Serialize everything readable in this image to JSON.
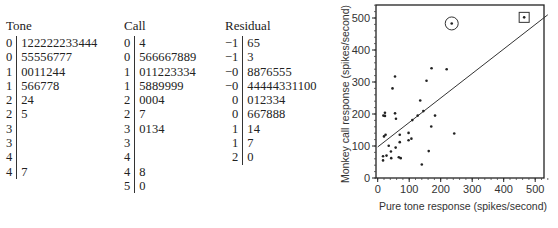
{
  "stem_plots": {
    "tone": {
      "title": "Tone",
      "rows": [
        {
          "stem": "0",
          "leaves": "122222233444"
        },
        {
          "stem": "0",
          "leaves": "55556777"
        },
        {
          "stem": "1",
          "leaves": "0011244"
        },
        {
          "stem": "1",
          "leaves": "566778"
        },
        {
          "stem": "2",
          "leaves": "24"
        },
        {
          "stem": "2",
          "leaves": "5"
        },
        {
          "stem": "3",
          "leaves": ""
        },
        {
          "stem": "3",
          "leaves": ""
        },
        {
          "stem": "4",
          "leaves": ""
        },
        {
          "stem": "4",
          "leaves": "7"
        }
      ]
    },
    "call": {
      "title": "Call",
      "rows": [
        {
          "stem": "0",
          "leaves": "4"
        },
        {
          "stem": "0",
          "leaves": "566667889"
        },
        {
          "stem": "1",
          "leaves": "011223334"
        },
        {
          "stem": "1",
          "leaves": "5889999"
        },
        {
          "stem": "2",
          "leaves": "0004"
        },
        {
          "stem": "2",
          "leaves": "7"
        },
        {
          "stem": "3",
          "leaves": "0134"
        },
        {
          "stem": "3",
          "leaves": ""
        },
        {
          "stem": "4",
          "leaves": ""
        },
        {
          "stem": "4",
          "leaves": "8"
        },
        {
          "stem": "5",
          "leaves": "0"
        }
      ]
    },
    "residual": {
      "title": "Residual",
      "rows": [
        {
          "stem": "−1",
          "leaves": "65"
        },
        {
          "stem": "−1",
          "leaves": "3"
        },
        {
          "stem": "−0",
          "leaves": "8876555"
        },
        {
          "stem": "−0",
          "leaves": "44444331100"
        },
        {
          "stem": "0",
          "leaves": "012334"
        },
        {
          "stem": "0",
          "leaves": "667888"
        },
        {
          "stem": "1",
          "leaves": "14"
        },
        {
          "stem": "1",
          "leaves": "7"
        },
        {
          "stem": "2",
          "leaves": "0"
        }
      ]
    }
  },
  "chart_data": {
    "type": "scatter",
    "title": "",
    "xlabel": "Pure tone response (spikes/second)",
    "ylabel": "Monkey call response (spikes/second)",
    "xlim": [
      0,
      540
    ],
    "ylim": [
      0,
      540
    ],
    "xticks": [
      0,
      100,
      200,
      300,
      400,
      500
    ],
    "yticks": [
      0,
      100,
      200,
      300,
      400,
      500
    ],
    "grid": false,
    "legend": null,
    "points": [
      {
        "x": 55,
        "y": 317
      },
      {
        "x": 47,
        "y": 280
      },
      {
        "x": 171,
        "y": 343
      },
      {
        "x": 219,
        "y": 340
      },
      {
        "x": 155,
        "y": 304
      },
      {
        "x": 18,
        "y": 195
      },
      {
        "x": 23,
        "y": 194
      },
      {
        "x": 23,
        "y": 204
      },
      {
        "x": 55,
        "y": 202
      },
      {
        "x": 58,
        "y": 185
      },
      {
        "x": 135,
        "y": 242
      },
      {
        "x": 145,
        "y": 209
      },
      {
        "x": 127,
        "y": 195
      },
      {
        "x": 110,
        "y": 181
      },
      {
        "x": 182,
        "y": 195
      },
      {
        "x": 170,
        "y": 161
      },
      {
        "x": 243,
        "y": 139
      },
      {
        "x": 20,
        "y": 130
      },
      {
        "x": 25,
        "y": 135
      },
      {
        "x": 70,
        "y": 135
      },
      {
        "x": 98,
        "y": 141
      },
      {
        "x": 98,
        "y": 118
      },
      {
        "x": 107,
        "y": 123
      },
      {
        "x": 70,
        "y": 112
      },
      {
        "x": 35,
        "y": 101
      },
      {
        "x": 57,
        "y": 95
      },
      {
        "x": 42,
        "y": 83
      },
      {
        "x": 162,
        "y": 84
      },
      {
        "x": 17,
        "y": 68
      },
      {
        "x": 28,
        "y": 70
      },
      {
        "x": 43,
        "y": 62
      },
      {
        "x": 67,
        "y": 65
      },
      {
        "x": 73,
        "y": 62
      },
      {
        "x": 17,
        "y": 55
      },
      {
        "x": 140,
        "y": 42
      }
    ],
    "highlighted_points": [
      {
        "x": 235,
        "y": 483,
        "marker": "circle"
      },
      {
        "x": 465,
        "y": 502,
        "marker": "square"
      }
    ],
    "fit_line": {
      "intercept": 97,
      "slope": 0.765
    }
  }
}
